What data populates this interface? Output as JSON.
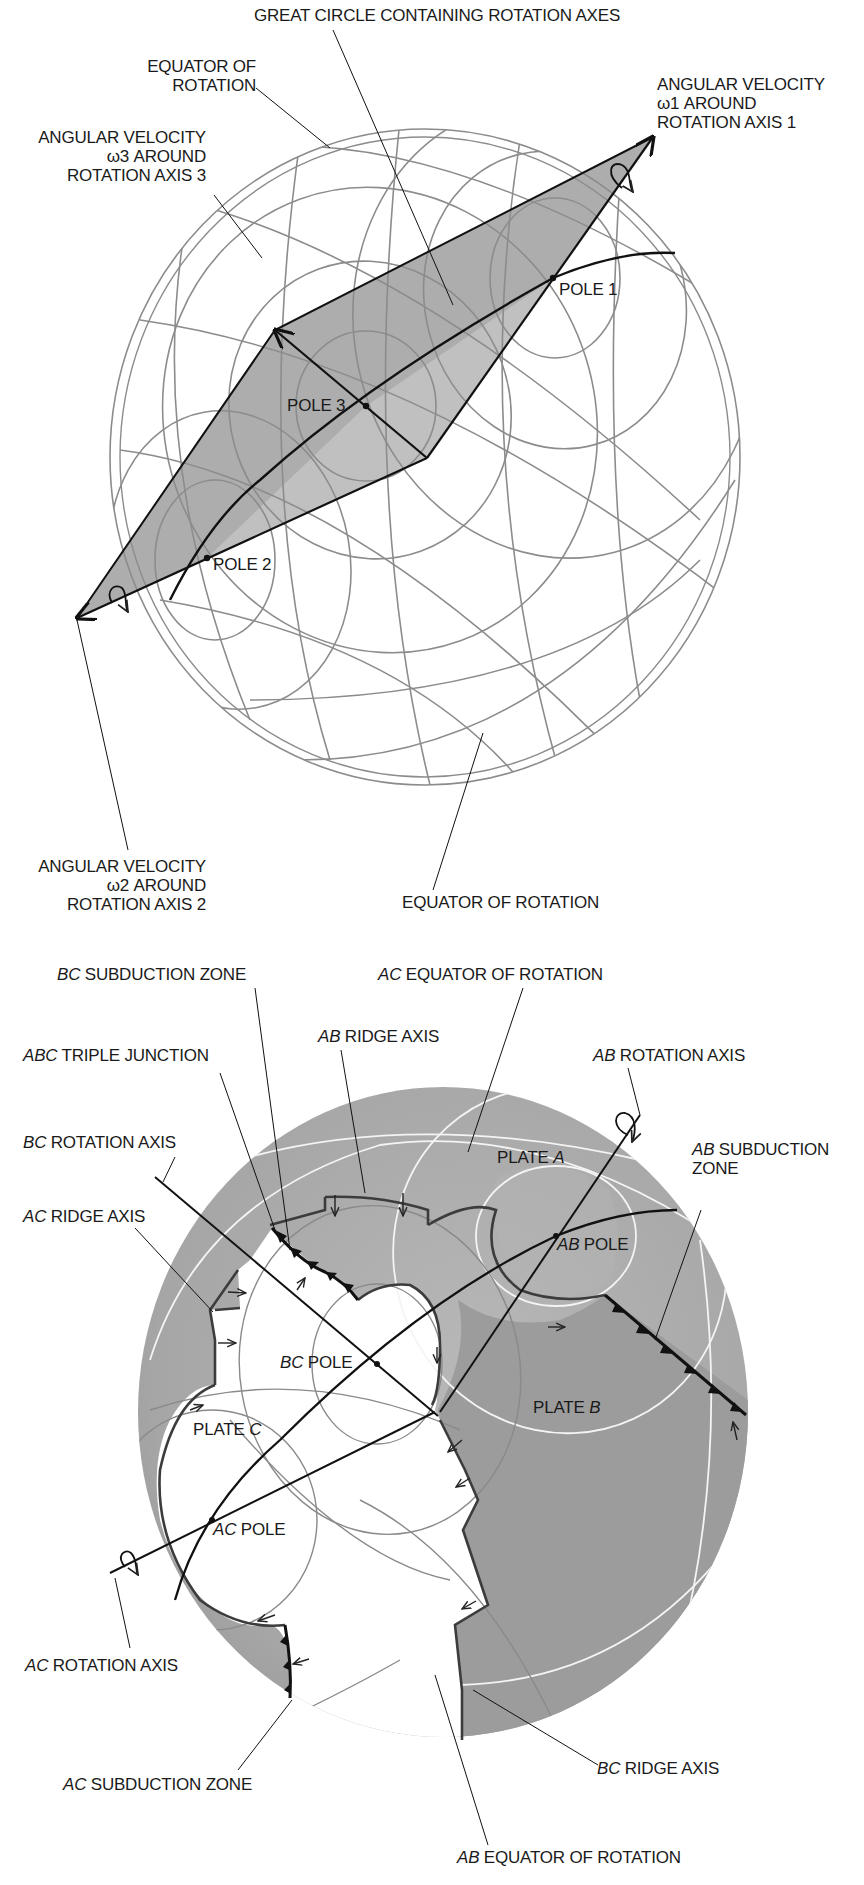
{
  "figure": {
    "top_diagram": {
      "name": "three-plate rotation vectors on sphere",
      "labels": {
        "great_circle": "GREAT CIRCLE CONTAINING ROTATION AXES",
        "equator_top_1": "EQUATOR OF",
        "equator_top_2": "ROTATION",
        "omega1_1": "ANGULAR VELOCITY",
        "omega1_2": "ω1 AROUND",
        "omega1_3": "ROTATION AXIS 1",
        "omega3_1": "ANGULAR VELOCITY",
        "omega3_2": "ω3 AROUND",
        "omega3_3": "ROTATION AXIS 3",
        "omega2_1": "ANGULAR VELOCITY",
        "omega2_2": "ω2 AROUND",
        "omega2_3": "ROTATION AXIS 2",
        "equator_bottom": "EQUATOR OF ROTATION",
        "pole1": "POLE 1",
        "pole2": "POLE 2",
        "pole3": "POLE 3"
      },
      "points": {
        "pole1": [
          553,
          278
        ],
        "pole2": [
          207,
          558
        ],
        "pole3": [
          366,
          406
        ],
        "omega1_tip": [
          653,
          137
        ],
        "omega2_tip": [
          77,
          618
        ],
        "omega3_tip": [
          275,
          330
        ],
        "lower_corner": [
          427,
          458
        ]
      }
    },
    "bottom_diagram": {
      "name": "triple junction of plates A, B, C",
      "labels": {
        "bc_subduction_it": "BC",
        "bc_subduction": " SUBDUCTION ZONE",
        "ac_equator_it": "AC",
        "ac_equator": " EQUATOR OF ROTATION",
        "ab_ridge_it": "AB",
        "ab_ridge": " RIDGE AXIS",
        "abc_triple_it": "ABC",
        "abc_triple": " TRIPLE JUNCTION",
        "ab_rotation_it": "AB",
        "ab_rotation": " ROTATION AXIS",
        "bc_rotation_it": "BC",
        "bc_rotation": " ROTATION AXIS",
        "ab_subduction_it": "AB",
        "ab_subduction_1": " SUBDUCTION",
        "ab_subduction_2": "ZONE",
        "ac_ridge_it": "AC",
        "ac_ridge": " RIDGE AXIS",
        "plate_a_pre": "PLATE ",
        "plate_a_it": "A",
        "plate_b_pre": "PLATE ",
        "plate_b_it": "B",
        "plate_c_pre": "PLATE ",
        "plate_c_it": "C",
        "ab_pole_it": "AB",
        "ab_pole": " POLE",
        "bc_pole_it": "BC",
        "bc_pole": " POLE",
        "ac_pole_it": "AC",
        "ac_pole": " POLE",
        "ac_rotation_it": "AC",
        "ac_rotation": " ROTATION AXIS",
        "ac_subduction_it": "AC",
        "ac_subduction": " SUBDUCTION ZONE",
        "bc_ridge_it": "BC",
        "bc_ridge": " RIDGE AXIS",
        "ab_equator_it": "AB",
        "ab_equator": " EQUATOR OF ROTATION"
      },
      "points": {
        "ab_pole": [
          556,
          1236
        ],
        "bc_pole": [
          377,
          1364
        ],
        "ac_pole": [
          212,
          1520
        ],
        "triple_junction": [
          272,
          1228
        ]
      }
    },
    "colors": {
      "grid_line": "#8c8c8c",
      "shaded_plane": "#a9a9a9",
      "sphere_fill": "#b0b0b0",
      "plate_b_fill": "#9a9a9a",
      "plate_c_fill": "#ffffff",
      "ink": "#111111"
    }
  }
}
